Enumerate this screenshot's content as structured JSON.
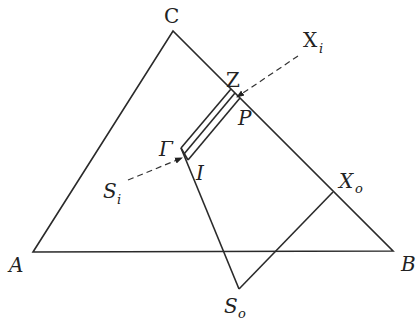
{
  "diagram": {
    "type": "geometry",
    "points": {
      "A": {
        "label": "A",
        "x": 33,
        "y": 252
      },
      "B": {
        "label": "B",
        "x": 393,
        "y": 251
      },
      "C": {
        "label": "C",
        "x": 173,
        "y": 31
      },
      "Gamma": {
        "label": "Γ",
        "x": 181,
        "y": 148
      },
      "I": {
        "label": "I",
        "x": 188,
        "y": 160
      },
      "Z": {
        "label": "Z",
        "x": 233,
        "y": 93
      },
      "P": {
        "label": "P",
        "x": 241,
        "y": 101
      },
      "Xo": {
        "label": "X",
        "sub": "o",
        "x": 333,
        "y": 192
      },
      "So": {
        "label": "S",
        "sub": "o",
        "x": 239,
        "y": 289
      }
    },
    "labels": {
      "C": "C",
      "A": "A",
      "B": "B",
      "Z": "Z",
      "P": "P",
      "Gamma": "Γ",
      "I": "I",
      "Xi_main": "X",
      "Xi_sub": "i",
      "Si_main": "S",
      "Si_sub": "i",
      "Xo_main": "X",
      "Xo_sub": "o",
      "So_main": "S",
      "So_sub": "o"
    },
    "arrows": [
      {
        "name": "Xi-arrow",
        "from": [
          298,
          56
        ],
        "to": [
          236,
          98
        ],
        "style": "dashed"
      },
      {
        "name": "Si-arrow",
        "from": [
          128,
          180
        ],
        "to": [
          183,
          157
        ],
        "style": "dashed"
      }
    ]
  }
}
